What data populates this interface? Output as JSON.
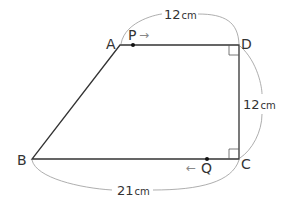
{
  "diagram": {
    "type": "trapezoid",
    "vertices": [
      {
        "label": "A",
        "x": 120,
        "y": 45
      },
      {
        "label": "D",
        "x": 239,
        "y": 45
      },
      {
        "label": "C",
        "x": 239,
        "y": 159
      },
      {
        "label": "B",
        "x": 32,
        "y": 159
      }
    ],
    "moving_points": [
      {
        "label": "P",
        "direction_arrow": "→",
        "on_side": "AD"
      },
      {
        "label": "Q",
        "direction_arrow": "←",
        "on_side": "CB"
      }
    ],
    "dimensions": [
      {
        "side": "AD",
        "value": "12",
        "unit": "cm"
      },
      {
        "side": "DC",
        "value": "12",
        "unit": "cm"
      },
      {
        "side": "BC",
        "value": "21",
        "unit": "cm"
      }
    ],
    "right_angles": [
      "D",
      "C"
    ]
  },
  "labels": {
    "A": "A",
    "B": "B",
    "C": "C",
    "D": "D",
    "P": "P",
    "Q": "Q",
    "p_arrow": "→",
    "q_arrow": "←",
    "top_value": "12",
    "top_unit": "cm",
    "right_value": "12",
    "right_unit": "cm",
    "bottom_value": "21",
    "bottom_unit": "cm"
  }
}
